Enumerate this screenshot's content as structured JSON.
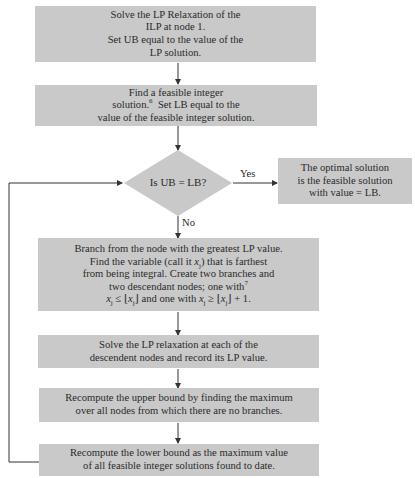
{
  "flowchart": {
    "step1": {
      "lines": [
        "Solve the LP Relaxation of the",
        "ILP at node 1.",
        "Set UB equal to the value of the",
        "LP solution."
      ]
    },
    "step2": {
      "lines": [
        "Find a feasible integer",
        "solution.",
        "Set LB equal to the",
        "value of the feasible integer solution."
      ],
      "footnote": "6"
    },
    "decision": {
      "label": "Is UB = LB?",
      "yes_label": "Yes",
      "no_label": "No"
    },
    "result": {
      "lines": [
        "The optimal solution",
        "is the feasible solution",
        "with value = LB."
      ]
    },
    "step3": {
      "lines": [
        "Branch from the node with the greatest LP value.",
        "Find the variable (call it ",
        ") that is farthest",
        "from being integral.  Create two branches and",
        "two descendant nodes; one with"
      ],
      "footnote": "7",
      "var": "x",
      "sub": "j",
      "cond1": "≤ ⌊",
      "cond1_end": "⌋ and one with ",
      "cond2": "≥ ⌊",
      "cond2_end": "⌋ + 1."
    },
    "step4": {
      "lines": [
        "Solve the LP relaxation at each of the",
        "descendent nodes and record its LP value."
      ]
    },
    "step5": {
      "lines": [
        "Recompute the upper bound by finding the maximum",
        "over all nodes from which there are no branches."
      ]
    },
    "step6": {
      "lines": [
        "Recompute the lower bound as the maximum value",
        "of all feasible integer solutions found to date."
      ]
    }
  }
}
